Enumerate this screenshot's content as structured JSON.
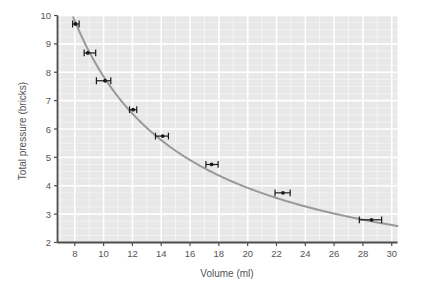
{
  "chart_data": {
    "type": "line",
    "title": "",
    "xlabel": "Volume (ml)",
    "ylabel": "Total pressure (bricks)",
    "xlim": [
      6.8,
      30.4
    ],
    "ylim": [
      2,
      10
    ],
    "xticks": [
      8,
      10,
      12,
      14,
      16,
      18,
      20,
      22,
      24,
      26,
      28,
      30
    ],
    "yticks": [
      2,
      3,
      4,
      5,
      6,
      7,
      8,
      9,
      10
    ],
    "xtick_labels": [
      "8",
      "10",
      "12",
      "14",
      "16",
      "18",
      "20",
      "22",
      "24",
      "26",
      "28",
      "30"
    ],
    "ytick_labels": [
      "2",
      "3",
      "4",
      "5",
      "6",
      "7",
      "8",
      "9",
      "10"
    ],
    "grid": true,
    "grid_minor": true,
    "legend": "none",
    "points": [
      {
        "x": 8.05,
        "y": 9.7,
        "xerr_low": 7.85,
        "xerr_high": 8.3
      },
      {
        "x": 8.9,
        "y": 8.68,
        "xerr_low": 8.65,
        "xerr_high": 9.45
      },
      {
        "x": 10.1,
        "y": 7.7,
        "xerr_low": 9.5,
        "xerr_high": 10.5
      },
      {
        "x": 12.05,
        "y": 6.68,
        "xerr_low": 11.8,
        "xerr_high": 12.3
      },
      {
        "x": 14.1,
        "y": 5.75,
        "xerr_low": 13.6,
        "xerr_high": 14.5
      },
      {
        "x": 17.5,
        "y": 4.75,
        "xerr_low": 17.1,
        "xerr_high": 17.95
      },
      {
        "x": 22.45,
        "y": 3.75,
        "xerr_low": 21.9,
        "xerr_high": 22.95
      },
      {
        "x": 28.6,
        "y": 2.8,
        "xerr_low": 27.75,
        "xerr_high": 29.3
      }
    ],
    "curve": {
      "relation": "p = k / V",
      "k": 78.5,
      "description": "smooth inverse hyperbola through the plotted points"
    },
    "colors": {
      "plot_background": "#e8e8e8",
      "gridline": "#ffffff",
      "curve": "#999999",
      "marker": "#1a1a1a",
      "axis": "#4d4d4d",
      "text": "#555555",
      "page_background": "#ffffff"
    }
  }
}
